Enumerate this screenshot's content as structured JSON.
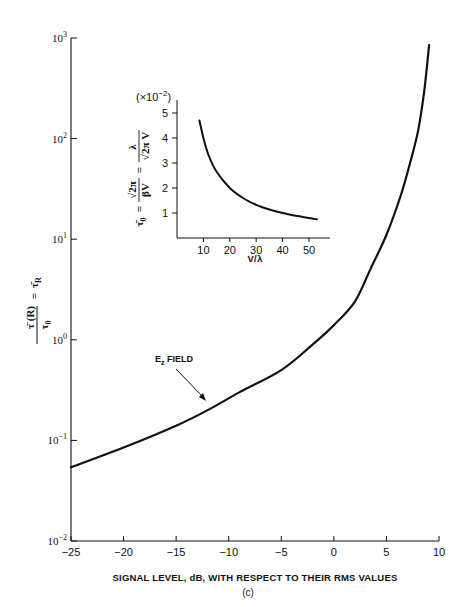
{
  "chart_data": [
    {
      "type": "line",
      "title": "",
      "xlabel": "SIGNAL LEVEL, dB, WITH RESPECT TO THEIR RMS VALUES",
      "ylabel": "τ̄(R)/τ₀ = τ̄_R",
      "yscale": "log",
      "xlim": [
        -25,
        10
      ],
      "ylim": [
        0.01,
        1000
      ],
      "grid": false,
      "xticks": [
        -25,
        -20,
        -15,
        -10,
        -5,
        0,
        5,
        10
      ],
      "xtick_labels": [
        "−25",
        "−20",
        "−15",
        "−10",
        "−5",
        "0",
        "5",
        "10"
      ],
      "yticks": [
        0.01,
        0.1,
        1,
        10,
        100,
        1000
      ],
      "ytick_labels": [
        {
          "base": "10",
          "exp": "−2"
        },
        {
          "base": "10",
          "exp": "−1"
        },
        {
          "base": "10",
          "exp": "0"
        },
        {
          "base": "10",
          "exp": "1"
        },
        {
          "base": "10",
          "exp": "2"
        },
        {
          "base": "10",
          "exp": "3"
        }
      ],
      "series": [
        {
          "name": "E_z FIELD",
          "x": [
            -25,
            -20,
            -15,
            -12,
            -9,
            -5,
            -2,
            0,
            2,
            3.5,
            5,
            6.3,
            7.2,
            8,
            8.6,
            9.06
          ],
          "values": [
            0.054,
            0.085,
            0.14,
            0.2,
            0.3,
            0.5,
            0.9,
            1.4,
            2.4,
            5.1,
            11,
            26,
            55,
            118,
            300,
            850
          ]
        }
      ],
      "annotations": [
        {
          "text": "E",
          "sub": "z",
          "suffix": " FIELD",
          "points_to": {
            "x": -12,
            "y": 0.24
          }
        }
      ],
      "caption": "(c)"
    },
    {
      "type": "line",
      "title": "",
      "inset": true,
      "xlabel": "V/λ",
      "ylabel": "τ̄₀ = √(2π)/(βV) = λ/(√(2π) V)",
      "y_multiplier": "(×10⁻²)",
      "xlim": [
        0,
        55
      ],
      "ylim": [
        0,
        5.5
      ],
      "grid": false,
      "xticks": [
        10,
        20,
        30,
        40,
        50
      ],
      "yticks": [
        1,
        2,
        3,
        4,
        5
      ],
      "series": [
        {
          "name": "τ̄₀",
          "x": [
            8.5,
            10,
            12,
            15,
            20,
            25,
            30,
            35,
            40,
            45,
            50,
            53
          ],
          "values": [
            4.7,
            4.0,
            3.3,
            2.65,
            2.0,
            1.6,
            1.33,
            1.14,
            1.0,
            0.89,
            0.8,
            0.75
          ]
        }
      ]
    }
  ],
  "figure": {
    "main": {
      "xlabel": "SIGNAL LEVEL, dB, WITH RESPECT TO THEIR RMS VALUES",
      "annotation_main": "E",
      "annotation_sub": "z",
      "annotation_rest": " FIELD",
      "caption": "(c)",
      "ylabel_parts": {
        "num": "τ̄ (R)",
        "den": "τ",
        "den_sub": "0",
        "eq": "=",
        "rhs": "τ̄",
        "rhs_sub": "R"
      }
    },
    "inset": {
      "multiplier_pre": "(×10",
      "multiplier_exp": "−2",
      "multiplier_post": ")",
      "xlabel": "V/λ",
      "ylabel_lhs": "τ̄",
      "ylabel_lhs_sub": "0",
      "ylabel_eq1": "=",
      "ylabel_frac1_num": "√2π",
      "ylabel_frac1_den": "βV",
      "ylabel_eq2": "=",
      "ylabel_frac2_num": "λ",
      "ylabel_frac2_den": "√2π V"
    }
  }
}
